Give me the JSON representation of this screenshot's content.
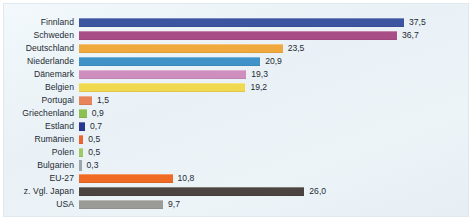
{
  "chart_data": {
    "type": "bar",
    "orientation": "horizontal",
    "title": "",
    "subtitle": "",
    "xlabel": "",
    "ylabel": "",
    "grid": false,
    "legend": "none",
    "xlim": [
      0,
      37.5
    ],
    "value_format": "german-decimal-comma",
    "categories": [
      "Finnland",
      "Schweden",
      "Deutschland",
      "Niederlande",
      "Dänemark",
      "Belgien",
      "Portugal",
      "Griechenland",
      "Estland",
      "Rumänien",
      "Polen",
      "Bulgarien",
      "EU-27",
      "z. Vgl. Japan",
      "USA"
    ],
    "values": [
      37.5,
      36.7,
      23.5,
      20.9,
      19.3,
      19.2,
      1.5,
      0.9,
      0.7,
      0.5,
      0.5,
      0.3,
      10.8,
      26.0,
      9.7
    ],
    "value_labels": [
      "37,5",
      "36,7",
      "23,5",
      "20,9",
      "19,3",
      "19,2",
      "1,5",
      "0,9",
      "0,7",
      "0,5",
      "0,5",
      "0,3",
      "10,8",
      "26,0",
      "9,7"
    ],
    "colors": [
      "#3b55a0",
      "#a94d86",
      "#f0a93c",
      "#3f93c9",
      "#cf8fbe",
      "#f0d84f",
      "#e8845a",
      "#8cc152",
      "#27368f",
      "#ef6330",
      "#9ccb63",
      "#9aa6ad",
      "#ef6a22",
      "#4b4440",
      "#9a9a96"
    ]
  },
  "rows": [
    {
      "label": "Finnland",
      "value": 37.5,
      "value_label": "37,5",
      "color": "#3b55a0"
    },
    {
      "label": "Schweden",
      "value": 36.7,
      "value_label": "36,7",
      "color": "#a94d86"
    },
    {
      "label": "Deutschland",
      "value": 23.5,
      "value_label": "23,5",
      "color": "#f0a93c"
    },
    {
      "label": "Niederlande",
      "value": 20.9,
      "value_label": "20,9",
      "color": "#3f93c9"
    },
    {
      "label": "Dänemark",
      "value": 19.3,
      "value_label": "19,3",
      "color": "#cf8fbe"
    },
    {
      "label": "Belgien",
      "value": 19.2,
      "value_label": "19,2",
      "color": "#f0d84f"
    },
    {
      "label": "Portugal",
      "value": 1.5,
      "value_label": "1,5",
      "color": "#e8845a"
    },
    {
      "label": "Griechenland",
      "value": 0.9,
      "value_label": "0,9",
      "color": "#8cc152"
    },
    {
      "label": "Estland",
      "value": 0.7,
      "value_label": "0,7",
      "color": "#27368f"
    },
    {
      "label": "Rumänien",
      "value": 0.5,
      "value_label": "0,5",
      "color": "#ef6330"
    },
    {
      "label": "Polen",
      "value": 0.5,
      "value_label": "0,5",
      "color": "#9ccb63"
    },
    {
      "label": "Bulgarien",
      "value": 0.3,
      "value_label": "0,3",
      "color": "#9aa6ad"
    },
    {
      "label": "EU-27",
      "value": 10.8,
      "value_label": "10,8",
      "color": "#ef6a22"
    },
    {
      "label": "z. Vgl. Japan",
      "value": 26.0,
      "value_label": "26,0",
      "color": "#4b4440"
    },
    {
      "label": "USA",
      "value": 9.7,
      "value_label": "9,7",
      "color": "#9a9a96"
    }
  ]
}
